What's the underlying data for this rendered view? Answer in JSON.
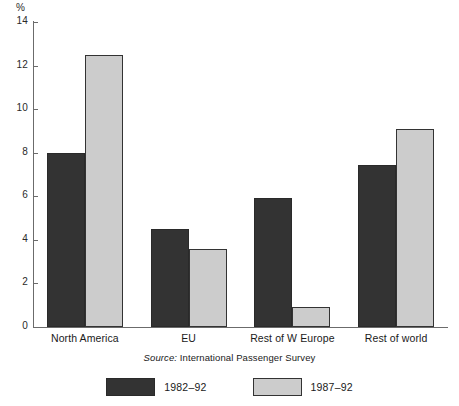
{
  "chart_data": {
    "type": "bar",
    "title": "",
    "subtitle": "",
    "xlabel": "",
    "ylabel": "%",
    "ylim": [
      0,
      14
    ],
    "ytick_step": 2,
    "yticks": [
      14,
      12,
      10,
      8,
      6,
      4,
      2,
      0
    ],
    "grid": false,
    "legend_position": "bottom",
    "categories": [
      "North America",
      "EU",
      "Rest of W Europe",
      "Rest of world"
    ],
    "series": [
      {
        "name": "1982–92",
        "color": "#333333",
        "values": [
          8.0,
          4.5,
          5.9,
          7.45
        ]
      },
      {
        "name": "1987–92",
        "color": "#cccccc",
        "values": [
          12.5,
          3.6,
          0.9,
          9.1
        ]
      }
    ],
    "source": {
      "prefix": "Source:",
      "text": "International Passenger Survey"
    }
  },
  "axis": {
    "unit_label": "%"
  }
}
